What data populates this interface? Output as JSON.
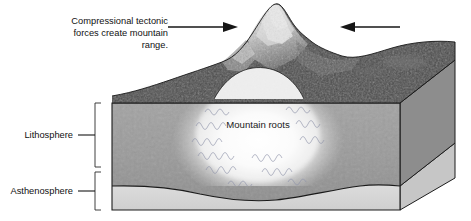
{
  "figure": {
    "background_color": "#ffffff",
    "width": 471,
    "height": 221
  },
  "callout": {
    "name": "compression-callout",
    "lines": [
      "Compressional tectonic",
      "forces create mountain",
      "range."
    ],
    "text_color": "#111111"
  },
  "arrows": [
    {
      "name": "left-compression-arrow",
      "direction": "right",
      "label": "compressional force from left",
      "color": "#161616"
    },
    {
      "name": "right-compression-arrow",
      "direction": "left",
      "label": "compressional force from right",
      "color": "#161616"
    }
  ],
  "layers": [
    {
      "name": "lithosphere",
      "label": "Lithosphere",
      "fill_color": "#9a9a9a",
      "side_fill_color": "#8d8d8d"
    },
    {
      "name": "asthenosphere",
      "label": "Asthenosphere",
      "fill_color": "#d5d5d5",
      "side_fill_color": "#c6c6c6"
    }
  ],
  "annotations": {
    "mountain_roots_label": "Mountain roots",
    "roots_glow_color": "#ffffff",
    "squiggle_color": "#8e93a8"
  },
  "terrain": {
    "name": "mountain-range-terrain",
    "surface_color": "#4a4a4a",
    "peak_snow_color": "#efefef",
    "description": "Snow-capped mountain peak rising above forested terrain"
  }
}
